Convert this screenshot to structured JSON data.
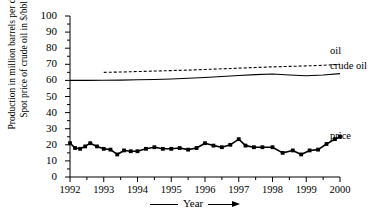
{
  "chart_data": {
    "type": "line",
    "title": "",
    "xlabel": "Year",
    "ylabel": "Production in million barrels per day Spot price of crude oil in $/bbl",
    "ylabel_line1": "Production in million barrels per day",
    "ylabel_line2": "Spot price of crude oil in $/bbl",
    "xlim": [
      1992,
      2000
    ],
    "ylim": [
      0,
      100
    ],
    "yticks": [
      0,
      10,
      20,
      30,
      40,
      50,
      60,
      70,
      80,
      90,
      100
    ],
    "ytick_labels": [
      "0",
      "10",
      "20",
      "30",
      "40",
      "50",
      "60",
      "70",
      "80",
      "90",
      "100"
    ],
    "xticks": [
      1992,
      1993,
      1994,
      1995,
      1996,
      1997,
      1998,
      1999,
      2000
    ],
    "xtick_labels": [
      "1992",
      "1993",
      "1994",
      "1995",
      "1996",
      "1997",
      "1998",
      "1999",
      "2000"
    ],
    "x_minor_ticks": [
      1992.5,
      1993.5,
      1994.5,
      1995.5,
      1996.5,
      1997.5,
      1998.5,
      1999.5
    ],
    "grid": false,
    "legend_position": "right-inline",
    "series": [
      {
        "name": "oil",
        "label": "oil",
        "style": "dashed",
        "color": "#000000",
        "x": [
          1993.0,
          1993.5,
          1994.0,
          1994.5,
          1995.0,
          1995.5,
          1996.0,
          1996.5,
          1997.0,
          1997.5,
          1998.0,
          1998.5,
          1999.0,
          1999.5,
          2000.0
        ],
        "values": [
          65.0,
          65.2,
          65.5,
          65.8,
          66.1,
          66.4,
          66.8,
          67.2,
          67.6,
          68.0,
          68.4,
          68.7,
          69.0,
          69.4,
          70.0
        ]
      },
      {
        "name": "crude-oil",
        "label": "crude oil",
        "style": "solid",
        "color": "#000000",
        "x": [
          1992.0,
          1992.5,
          1993.0,
          1993.5,
          1994.0,
          1994.5,
          1995.0,
          1995.5,
          1996.0,
          1996.5,
          1997.0,
          1997.5,
          1998.0,
          1998.5,
          1999.0,
          1999.5,
          2000.0
        ],
        "values": [
          60.0,
          60.0,
          60.1,
          60.2,
          60.4,
          60.6,
          60.9,
          61.3,
          61.8,
          62.4,
          63.0,
          63.6,
          64.0,
          63.4,
          62.9,
          63.4,
          64.2
        ]
      },
      {
        "name": "price",
        "label": "price",
        "style": "solid-markers",
        "color": "#000000",
        "x": [
          1992.0,
          1992.15,
          1992.3,
          1992.45,
          1992.6,
          1992.8,
          1993.0,
          1993.2,
          1993.4,
          1993.6,
          1993.8,
          1994.0,
          1994.25,
          1994.5,
          1994.75,
          1995.0,
          1995.25,
          1995.5,
          1995.75,
          1996.0,
          1996.25,
          1996.5,
          1996.75,
          1997.0,
          1997.2,
          1997.45,
          1997.7,
          1998.0,
          1998.3,
          1998.6,
          1998.85,
          1999.1,
          1999.35,
          1999.6,
          1999.85,
          2000.0
        ],
        "values": [
          21.0,
          18.0,
          17.5,
          19.0,
          21.0,
          19.0,
          17.5,
          17.0,
          14.0,
          16.5,
          16.0,
          16.0,
          17.5,
          18.5,
          17.5,
          17.5,
          18.0,
          17.0,
          18.0,
          21.0,
          19.5,
          18.5,
          20.0,
          23.5,
          19.5,
          18.5,
          18.5,
          18.5,
          15.0,
          16.5,
          14.0,
          16.5,
          17.0,
          20.5,
          23.5,
          25.0
        ]
      }
    ]
  }
}
